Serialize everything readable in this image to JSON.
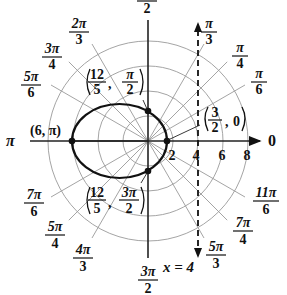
{
  "diagram": {
    "type": "polar-graph",
    "center": {
      "x": 148,
      "y": 141
    },
    "px_per_unit": 12.5,
    "colors": {
      "grid": "#9a9a9a",
      "axis": "#222222",
      "curve": "#111111",
      "text": "#111111",
      "background": "#ffffff"
    },
    "grid": {
      "radii": [
        1,
        2,
        3,
        4,
        5,
        6,
        7,
        8
      ],
      "ray_angles_deg": [
        0,
        30,
        45,
        60,
        90,
        120,
        135,
        150,
        180,
        210,
        225,
        240,
        270,
        300,
        315,
        330
      ]
    },
    "polar_axis": {
      "label": "0",
      "tick_labels": [
        "2",
        "4",
        "6",
        "8"
      ],
      "tick_values": [
        2,
        4,
        6,
        8
      ]
    },
    "angle_labels": [
      {
        "angle": "0",
        "num": "0",
        "den": ""
      },
      {
        "angle": "pi/6",
        "num": "π",
        "den": "6"
      },
      {
        "angle": "pi/4",
        "num": "π",
        "den": "4"
      },
      {
        "angle": "pi/3",
        "num": "π",
        "den": "3"
      },
      {
        "angle": "pi/2",
        "num": "π",
        "den": "2"
      },
      {
        "angle": "2pi/3",
        "num": "2π",
        "den": "3"
      },
      {
        "angle": "3pi/4",
        "num": "3π",
        "den": "4"
      },
      {
        "angle": "5pi/6",
        "num": "5π",
        "den": "6"
      },
      {
        "angle": "pi",
        "num": "π",
        "den": ""
      },
      {
        "angle": "7pi/6",
        "num": "7π",
        "den": "6"
      },
      {
        "angle": "5pi/4",
        "num": "5π",
        "den": "4"
      },
      {
        "angle": "4pi/3",
        "num": "4π",
        "den": "3"
      },
      {
        "angle": "3pi/2",
        "num": "3π",
        "den": "2"
      },
      {
        "angle": "5pi/3",
        "num": "5π",
        "den": "3"
      },
      {
        "angle": "7pi/4",
        "num": "7π",
        "den": "4"
      },
      {
        "angle": "11pi/6",
        "num": "11π",
        "den": "6"
      }
    ],
    "curve": {
      "type": "ellipse",
      "center_x": 119.5,
      "center_y": 141,
      "rx": 47.5,
      "ry": 37
    },
    "points": [
      {
        "label": "(6, π)",
        "r": 6,
        "theta": "π"
      },
      {
        "label_r_num": "12",
        "label_r_den": "5",
        "label_t_num": "π",
        "label_t_den": "2",
        "r": 2.4,
        "theta": "π/2"
      },
      {
        "label_r_num": "3",
        "label_r_den": "2",
        "label_t": "0",
        "r": 1.5,
        "theta": "0"
      },
      {
        "label_r_num": "12",
        "label_r_den": "5",
        "label_t_num": "3π",
        "label_t_den": "2",
        "r": 2.4,
        "theta": "3π/2"
      }
    ],
    "directrix": {
      "label": "x = 4",
      "x_value": 4,
      "style": "dashed"
    }
  },
  "labels": {
    "pi_half_num": "π",
    "pi_half_den": "2",
    "pi_left": "π",
    "zero_right": "0",
    "pi6_num": "π",
    "pi6_den": "6",
    "pi4_num": "π",
    "pi4_den": "4",
    "pi3_num": "π",
    "pi3_den": "3",
    "p2pi3_num": "2π",
    "p2pi3_den": "3",
    "p3pi4_num": "3π",
    "p3pi4_den": "4",
    "p5pi6_num": "5π",
    "p5pi6_den": "6",
    "p7pi6_num": "7π",
    "p7pi6_den": "6",
    "p5pi4_num": "5π",
    "p5pi4_den": "4",
    "p4pi3_num": "4π",
    "p4pi3_den": "3",
    "p3pi2_num": "3π",
    "p3pi2_den": "2",
    "p5pi3_num": "5π",
    "p5pi3_den": "3",
    "p7pi4_num": "7π",
    "p7pi4_den": "4",
    "p11pi6_num": "11π",
    "p11pi6_den": "6",
    "tick_2": "2",
    "tick_4": "4",
    "tick_6": "6",
    "tick_8": "8",
    "point_6pi": "(6, π)",
    "pt_top_r_num": "12",
    "pt_top_r_den": "5",
    "pt_top_t_num": "π",
    "pt_top_t_den": "2",
    "pt_bot_r_num": "12",
    "pt_bot_r_den": "5",
    "pt_bot_t_num": "3π",
    "pt_bot_t_den": "2",
    "pt_right_r_num": "3",
    "pt_right_r_den": "2",
    "pt_right_t": "0",
    "comma": ",",
    "directrix_label": "x = 4"
  }
}
